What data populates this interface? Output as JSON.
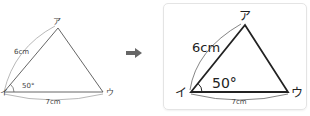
{
  "left_figure": {
    "vertices": {
      "top": "ア",
      "left": "イ",
      "right": "ウ"
    },
    "side_left": "6cm",
    "side_bottom": "7cm",
    "angle": "50°"
  },
  "arrow": {
    "icon": "arrow-right-icon",
    "color": "#666666"
  },
  "right_figure": {
    "vertices": {
      "top": "ア",
      "left": "イ",
      "right": "ウ"
    },
    "side_left": "6cm",
    "side_bottom": "7cm",
    "angle": "50°"
  }
}
